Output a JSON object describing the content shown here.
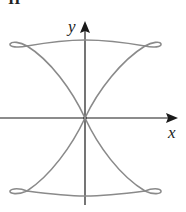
{
  "figure": {
    "panel_label": "II",
    "axes": {
      "x_label": "x",
      "y_label": "y"
    },
    "colors": {
      "curve": "#8a8a8a",
      "axis": "#1a1a1a"
    }
  }
}
